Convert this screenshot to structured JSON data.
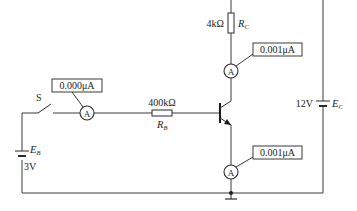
{
  "diagram": {
    "type": "circuit",
    "switch": {
      "label": "S"
    },
    "base_supply": {
      "label": "E",
      "subscript": "B",
      "voltage": "3V"
    },
    "collector_supply": {
      "label": "E",
      "subscript": "C",
      "voltage": "12V"
    },
    "base_resistor": {
      "label": "R",
      "subscript": "B",
      "value": "400kΩ"
    },
    "collector_resistor": {
      "label": "R",
      "subscript": "C",
      "value": "4kΩ"
    },
    "ammeters": [
      {
        "position": "base",
        "symbol": "A",
        "reading": "0.000μA"
      },
      {
        "position": "collector",
        "symbol": "A",
        "reading": "0.001μA"
      },
      {
        "position": "emitter",
        "symbol": "A",
        "reading": "0.001μA"
      }
    ],
    "transistor": {
      "type": "NPN"
    },
    "ground": true
  }
}
